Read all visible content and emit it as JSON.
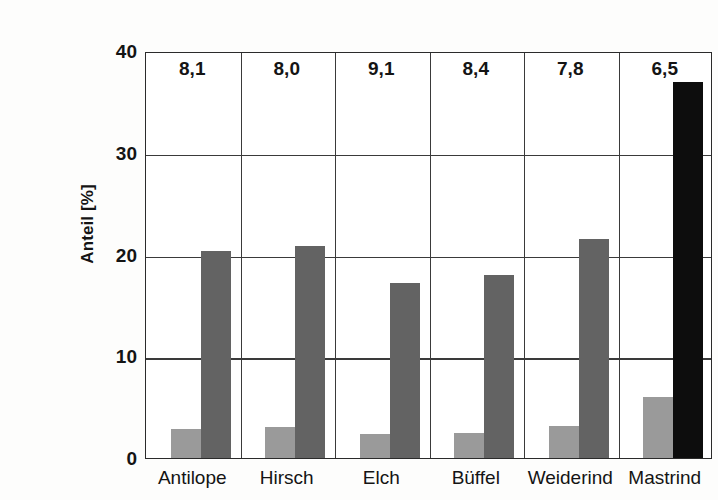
{
  "chart_data": {
    "type": "bar",
    "title": "",
    "xlabel": "",
    "ylabel": "Anteil [%]",
    "ylim": [
      0,
      40
    ],
    "yticks": [
      "0",
      "10",
      "20",
      "30",
      "40"
    ],
    "grid": true,
    "legend": "none",
    "categories": [
      "Antilope",
      "Hirsch",
      "Elch",
      "Büffel",
      "Weiderind",
      "Mastrind"
    ],
    "annotations": [
      "8,1",
      "8,0",
      "9,1",
      "8,4",
      "7,8",
      "6,5"
    ],
    "series": [
      {
        "name": "heller Balken",
        "color": "#9a9a9a",
        "values": [
          2.9,
          3.0,
          2.4,
          2.5,
          3.1,
          6.0
        ]
      },
      {
        "name": "dunkler Balken",
        "color": "#636363",
        "values": [
          20.3,
          20.8,
          17.2,
          18.0,
          21.5,
          37.0
        ],
        "point_colors": [
          "#636363",
          "#636363",
          "#636363",
          "#636363",
          "#636363",
          "#0d0d0d"
        ]
      }
    ]
  },
  "axis": {
    "y_title": "Anteil [%]",
    "ticks": [
      {
        "label": "40",
        "value": 40
      },
      {
        "label": "30",
        "value": 30
      },
      {
        "label": "20",
        "value": 20
      },
      {
        "label": "10",
        "value": 10
      },
      {
        "label": "0",
        "value": 0
      }
    ]
  },
  "colors": {
    "light_bar": "#9a9a9a",
    "dark_bar": "#636363",
    "black_bar": "#0d0d0d",
    "axis": "#2b2b2b",
    "grid": "#3a3a3a",
    "text": "#141414",
    "background": "#fdfdfc"
  }
}
